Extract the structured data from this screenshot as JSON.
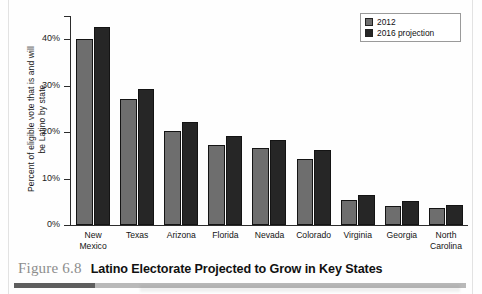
{
  "figure": {
    "number": "Figure 6.8",
    "title": "Latino Electorate Projected to Grow in Key States"
  },
  "legend": {
    "items": [
      {
        "label": "2012",
        "color": "#6e6e6e"
      },
      {
        "label": "2016 projection",
        "color": "#262626"
      }
    ]
  },
  "axis": {
    "y_title_line1": "Percent of eligible vote that is and will",
    "y_title_line2": "be Latino by state",
    "ticks": [
      "0%",
      "10%",
      "20%",
      "30%",
      "40%"
    ]
  },
  "chart_data": {
    "type": "bar",
    "title": "Latino Electorate Projected to Grow in Key States",
    "xlabel": "",
    "ylabel": "Percent of eligible vote that is and will be Latino by state",
    "ylim": [
      0,
      45
    ],
    "ytick_values": [
      0,
      10,
      20,
      30,
      40
    ],
    "ytick_labels": [
      "0%",
      "10%",
      "20%",
      "30%",
      "40%"
    ],
    "grid": false,
    "legend_position": "top-right",
    "categories": [
      "New Mexico",
      "Texas",
      "Arizona",
      "Florida",
      "Nevada",
      "Colorado",
      "Virginia",
      "Georgia",
      "North Carolina"
    ],
    "series": [
      {
        "name": "2012",
        "color": "#6e6e6e",
        "values": [
          40.0,
          27.2,
          20.2,
          17.2,
          16.6,
          14.3,
          5.4,
          4.2,
          3.6
        ]
      },
      {
        "name": "2016 projection",
        "color": "#262626",
        "values": [
          42.6,
          29.3,
          22.2,
          19.1,
          18.3,
          16.2,
          6.4,
          5.2,
          4.3
        ]
      }
    ]
  }
}
